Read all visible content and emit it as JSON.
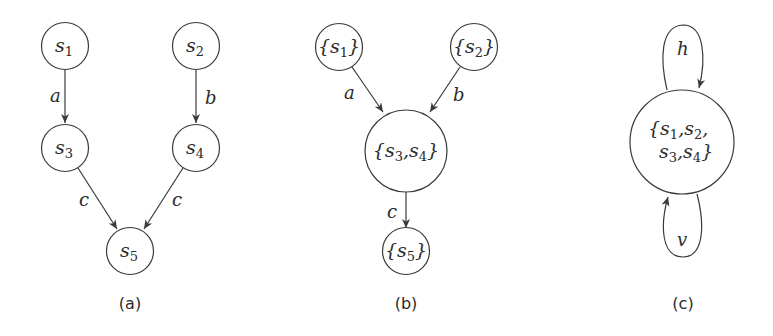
{
  "panels": [
    {
      "caption": "(a)",
      "nodes": [
        {
          "id": "s1",
          "base": "s",
          "sub": "1",
          "open": "",
          "close": ""
        },
        {
          "id": "s2",
          "base": "s",
          "sub": "2",
          "open": "",
          "close": ""
        },
        {
          "id": "s3",
          "base": "s",
          "sub": "3",
          "open": "",
          "close": ""
        },
        {
          "id": "s4",
          "base": "s",
          "sub": "4",
          "open": "",
          "close": ""
        },
        {
          "id": "s5",
          "base": "s",
          "sub": "5",
          "open": "",
          "close": ""
        }
      ],
      "edges": [
        {
          "from": "s1",
          "to": "s3",
          "label": "a"
        },
        {
          "from": "s2",
          "to": "s4",
          "label": "b"
        },
        {
          "from": "s3",
          "to": "s5",
          "label": "c"
        },
        {
          "from": "s4",
          "to": "s5",
          "label": "c"
        }
      ]
    },
    {
      "caption": "(b)",
      "nodes": [
        {
          "id": "{s1}",
          "open": "{",
          "base": "s",
          "sub": "1",
          "close": "}"
        },
        {
          "id": "{s2}",
          "open": "{",
          "base": "s",
          "sub": "2",
          "close": "}"
        },
        {
          "id": "{s3,s4}",
          "open": "{",
          "parts": [
            {
              "base": "s",
              "sub": "3"
            },
            {
              "base": "s",
              "sub": "4"
            }
          ],
          "sep": ",",
          "close": "}"
        },
        {
          "id": "{s5}",
          "open": "{",
          "base": "s",
          "sub": "5",
          "close": "}"
        }
      ],
      "edges": [
        {
          "from": "{s1}",
          "to": "{s3,s4}",
          "label": "a"
        },
        {
          "from": "{s2}",
          "to": "{s3,s4}",
          "label": "b"
        },
        {
          "from": "{s3,s4}",
          "to": "{s5}",
          "label": "c"
        }
      ]
    },
    {
      "caption": "(c)",
      "nodes": [
        {
          "id": "{s1,s2,s3,s4}",
          "open": "{",
          "parts": [
            {
              "base": "s",
              "sub": "1"
            },
            {
              "base": "s",
              "sub": "2"
            },
            {
              "base": "s",
              "sub": "3"
            },
            {
              "base": "s",
              "sub": "4"
            }
          ],
          "sep": ",",
          "close": "}"
        }
      ],
      "edges": [
        {
          "from": "{s1,s2,s3,s4}",
          "to": "{s1,s2,s3,s4}",
          "label": "h",
          "type": "self-loop-top"
        },
        {
          "from": "{s1,s2,s3,s4}",
          "to": "{s1,s2,s3,s4}",
          "label": "v",
          "type": "self-loop-bottom"
        }
      ]
    }
  ],
  "colors": {
    "stroke": "#3a3a3a",
    "text": "#2b2b2b",
    "background": "#ffffff"
  }
}
